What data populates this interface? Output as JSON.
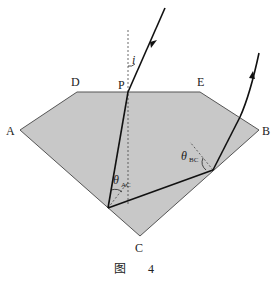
{
  "diagram": {
    "type": "optics-prism-ray-diagram",
    "points": {
      "A": {
        "label": "A",
        "x": 20,
        "y": 130
      },
      "B": {
        "label": "B",
        "x": 259,
        "y": 130
      },
      "C": {
        "label": "C",
        "x": 140,
        "y": 236
      },
      "D": {
        "label": "D",
        "x": 77,
        "y": 92
      },
      "E": {
        "label": "E",
        "x": 200,
        "y": 92
      },
      "P": {
        "label": "P",
        "x": 128,
        "y": 92
      }
    },
    "labels": {
      "A": "A",
      "B": "B",
      "C": "C",
      "D": "D",
      "E": "E",
      "P": "P",
      "incidence_angle": "i",
      "theta": "θ",
      "theta_ac_sub": "AC",
      "theta_bc_sub": "BC"
    },
    "caption": {
      "figure_char": "图",
      "number": "4"
    },
    "colors": {
      "prism_fill": "#c8c8c8",
      "prism_stroke": "#555555",
      "ray": "#111111",
      "normal": "#444444"
    }
  }
}
